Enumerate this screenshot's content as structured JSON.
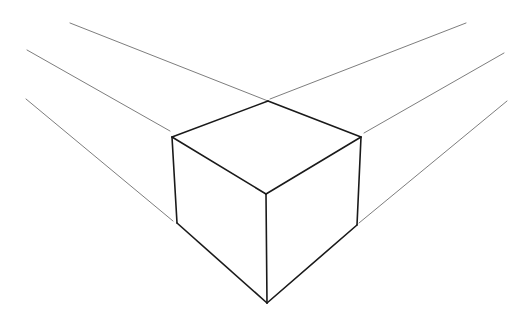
{
  "page": {
    "background_color": "#ffffff",
    "width": 532,
    "height": 320
  },
  "drawing": {
    "type": "line-drawing",
    "subject": "cube-in-two-point-perspective",
    "face_fill_color": "#ffffff",
    "cube_edge_color": "#1a1a1a",
    "cube_edge_width": 1.6,
    "guide_line_color": "#6e6e6e",
    "guide_line_width": 0.9,
    "vertices": {
      "top_back": [
        268,
        101
      ],
      "top_left": [
        172,
        137
      ],
      "top_right": [
        361,
        137
      ],
      "top_front": [
        266,
        194
      ],
      "bottom_left": [
        177,
        223
      ],
      "bottom_right": [
        357,
        225
      ],
      "bottom_front": [
        267,
        303
      ]
    },
    "faces": [
      {
        "name": "top-face",
        "points": "268,101 172,137 266,194 361,137"
      },
      {
        "name": "left-face",
        "points": "172,137 266,194 267,303 177,223"
      },
      {
        "name": "right-face",
        "points": "361,137 266,194 267,303 357,225"
      }
    ],
    "cube_edges": [
      {
        "name": "top-edge-back-left",
        "d": "M 268,101 L 172,137"
      },
      {
        "name": "top-edge-back-right",
        "d": "M 268,101 L 361,137"
      },
      {
        "name": "top-edge-front-left",
        "d": "M 172,137 L 266,194"
      },
      {
        "name": "top-edge-front-right",
        "d": "M 361,137 L 266,194"
      },
      {
        "name": "vertical-edge-left",
        "d": "M 172,137 L 177,223"
      },
      {
        "name": "vertical-edge-front",
        "d": "M 266,194 L 267,303"
      },
      {
        "name": "vertical-edge-right",
        "d": "M 361,137 L 357,225"
      },
      {
        "name": "bottom-edge-left",
        "d": "M 177,223 L 267,303"
      },
      {
        "name": "bottom-edge-right",
        "d": "M 357,225 L 267,303"
      }
    ],
    "guide_lines": [
      {
        "name": "guide-left-upper",
        "d": "M 70,23 L 268,101",
        "side": "left",
        "converges_to": "top_back"
      },
      {
        "name": "guide-left-middle",
        "d": "M 27,50 L 170,131",
        "side": "left",
        "converges_to": "top_left"
      },
      {
        "name": "guide-left-lower",
        "d": "M 26,99 L 173,221",
        "side": "left",
        "converges_to": "bottom_left"
      },
      {
        "name": "guide-right-upper",
        "d": "M 270,99 L 466,23",
        "side": "right",
        "converges_to": "top_back"
      },
      {
        "name": "guide-right-middle",
        "d": "M 364,133 L 504,53",
        "side": "right",
        "converges_to": "top_right"
      },
      {
        "name": "guide-right-lower",
        "d": "M 359,223 L 507,101",
        "side": "right",
        "converges_to": "bottom_right"
      }
    ]
  }
}
